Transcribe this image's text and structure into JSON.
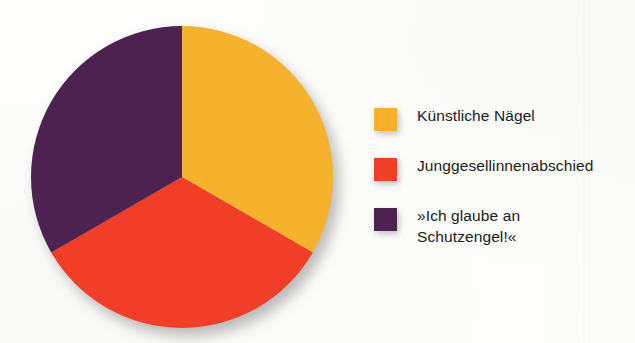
{
  "background_color": "#fdfdfc",
  "chart_data": {
    "type": "pie",
    "title": "",
    "subtitle": "",
    "xlabel": "",
    "ylabel": "",
    "legend_position": "right",
    "grid": false,
    "start_angle_deg": 0,
    "direction": "clockwise",
    "categories": [
      "Künstliche Nägel",
      "Junggesellinnenabschied",
      "»Ich glaube an Schutzengel!«"
    ],
    "values": [
      33.3,
      33.3,
      33.3
    ],
    "value_unit": "%",
    "slice_angles_deg": [
      120,
      120,
      120
    ],
    "colors": [
      "#f6b22c",
      "#f03e28",
      "#4d2150"
    ],
    "series": [
      {
        "name": "Anteil",
        "values": [
          33.3,
          33.3,
          33.3
        ]
      }
    ],
    "slices": [
      {
        "label": "Künstliche Nägel",
        "value": 33.3,
        "color": "#f6b22c",
        "start_deg": 0,
        "end_deg": 120
      },
      {
        "label": "Junggesellinnenabschied",
        "value": 33.3,
        "color": "#f03e28",
        "start_deg": 120,
        "end_deg": 240
      },
      {
        "label": "»Ich glaube an Schutzengel!«",
        "value": 33.3,
        "color": "#4d2150",
        "start_deg": 240,
        "end_deg": 360
      }
    ],
    "annotations": [],
    "data_labels_shown": false
  },
  "pie": {
    "center_x": 151,
    "center_y": 151,
    "radius": 151
  },
  "legend": {
    "items": [
      {
        "label": "Künstliche Nägel",
        "color": "#f6b22c",
        "swatch_name": "legend-swatch-kuenstliche-naegel"
      },
      {
        "label": "Junggesellinnenabschied",
        "color": "#f03e28",
        "swatch_name": "legend-swatch-junggesellinnenabschied"
      },
      {
        "label": "»Ich glaube an\nSchutzengel!«",
        "color": "#4d2150",
        "swatch_name": "legend-swatch-schutzengel"
      }
    ]
  }
}
